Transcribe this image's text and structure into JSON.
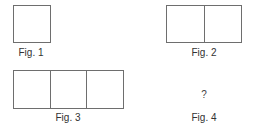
{
  "figures": [
    {
      "label": "Fig. 1",
      "squares": 1
    },
    {
      "label": "Fig. 2",
      "squares": 2
    },
    {
      "label": "Fig. 3",
      "squares": 3
    },
    {
      "label": "Fig. 4",
      "squares": null,
      "content": "?"
    }
  ],
  "colors": {
    "stroke": "#6e6e6e",
    "text": "#333333",
    "background": "#ffffff"
  }
}
